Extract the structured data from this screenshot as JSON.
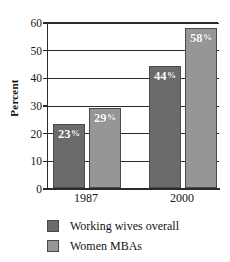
{
  "chart_data": {
    "type": "bar",
    "title": "",
    "xlabel": "",
    "ylabel": "Percent",
    "ylim": [
      0,
      60
    ],
    "yticks": [
      0,
      10,
      20,
      30,
      40,
      50,
      60
    ],
    "ytick_labels": [
      "0",
      "10",
      "20",
      "30",
      "40",
      "50",
      "60"
    ],
    "grid": true,
    "legend_position": "bottom-left",
    "categories": [
      "1987",
      "2000"
    ],
    "series": [
      {
        "name": "Working wives overall",
        "color": "#6b6b6b",
        "values": [
          23,
          29
        ],
        "data_labels": [
          "23%",
          "29%"
        ]
      },
      {
        "name": "Women MBAs",
        "color": "#969696",
        "values": [
          29,
          58
        ],
        "data_labels": [
          "29%",
          "58%"
        ]
      }
    ],
    "bars": [
      {
        "group": "1987",
        "series": "Working wives overall",
        "value": 23,
        "label_number": "23",
        "label_pct": "%",
        "color": "#6b6b6b"
      },
      {
        "group": "1987",
        "series": "Women MBAs",
        "value": 29,
        "label_number": "29",
        "label_pct": "%",
        "color": "#969696"
      },
      {
        "group": "2000",
        "series": "Working wives overall",
        "value": 44,
        "label_number": "44",
        "label_pct": "%",
        "color": "#6b6b6b"
      },
      {
        "group": "2000",
        "series": "Women MBAs",
        "value": 58,
        "label_number": "58",
        "label_pct": "%",
        "color": "#969696"
      }
    ]
  },
  "legend": {
    "items": [
      {
        "label": "Working wives overall",
        "color": "#6b6b6b"
      },
      {
        "label": "Women MBAs",
        "color": "#969696"
      }
    ]
  },
  "colors": {
    "series_dark": "#6b6b6b",
    "series_light": "#969696",
    "axis": "#2b2b2b",
    "background": "#ffffff",
    "label_text": "#ffffff"
  }
}
